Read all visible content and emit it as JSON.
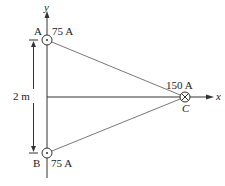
{
  "diagram": {
    "axes": {
      "x_label": "x",
      "y_label": "y"
    },
    "wires": [
      {
        "id": "A",
        "label": "A",
        "current": "75 A",
        "direction": "out-of-page"
      },
      {
        "id": "B",
        "label": "B",
        "current": "75 A",
        "direction": "out-of-page"
      },
      {
        "id": "C",
        "label": "C",
        "current": "150 A",
        "direction": "into-page"
      }
    ],
    "dimension": {
      "label": "2 m"
    }
  }
}
